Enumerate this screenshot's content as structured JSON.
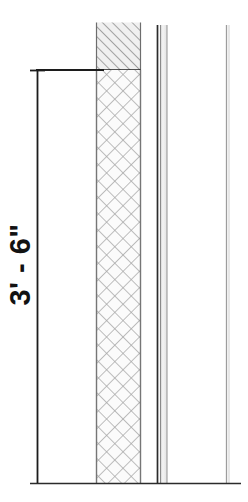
{
  "drawing": {
    "title": "Wall section detail",
    "background_color": "#ffffff",
    "line_color": "#1a1a1a",
    "hatch_color": "#9a9a9a",
    "insulation_color": "#8c8c8c",
    "fill_color": "#f5f5f5"
  },
  "dimension": {
    "label": "3' - 6\"",
    "feet": 3,
    "inches": 6,
    "orientation": "vertical",
    "text_rotation_degrees": -90,
    "extension_line_top_y": 70,
    "extension_line_bottom_y": 483,
    "dimension_line_x": 37
  },
  "layers": [
    {
      "name": "cmu-wall-core",
      "pattern": "diagonal-crosshatch",
      "x": 96,
      "width": 45,
      "top_y": 70,
      "bottom_y": 483
    },
    {
      "name": "insulation-cap",
      "pattern": "diagonal-hatch",
      "x": 96,
      "width": 45,
      "top_y": 22,
      "bottom_y": 70
    },
    {
      "name": "air-gap-line",
      "pattern": "solid-line",
      "x": 157,
      "top_y": 25,
      "bottom_y": 483
    },
    {
      "name": "finish-band",
      "pattern": "thin-band",
      "x": 160,
      "width": 7,
      "top_y": 25,
      "bottom_y": 483
    },
    {
      "name": "far-face-line",
      "pattern": "light-line",
      "x": 227,
      "top_y": 25,
      "bottom_y": 483
    }
  ],
  "baseline": {
    "name": "floor-line",
    "y": 483,
    "x_start": 30,
    "x_end": 241
  }
}
